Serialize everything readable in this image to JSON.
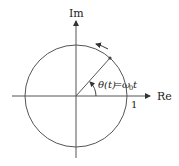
{
  "diagram": {
    "axes": {
      "x_label": "Re",
      "y_label": "Im"
    },
    "tick_label": "1",
    "angle_label": "θ(t) = ω₀t",
    "angle_label_parts": {
      "lhs": "θ(t)",
      "eq": "=",
      "rhs_omega": "ω",
      "rhs_sub": "0",
      "rhs_t": "t"
    },
    "colors": {
      "stroke": "#555555",
      "text": "#222222",
      "background": "#ffffff"
    },
    "geometry": {
      "center": [
        76,
        96
      ],
      "radius": 51,
      "phasor_angle_deg": 49
    }
  }
}
